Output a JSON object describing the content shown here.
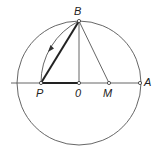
{
  "diagram": {
    "title": "",
    "type": "geometric-construction",
    "stroke_color": "#444444",
    "points": [
      {
        "id": "B",
        "label": "B",
        "x": 79,
        "y": 21
      },
      {
        "id": "P",
        "label": "P",
        "x": 41,
        "y": 83
      },
      {
        "id": "O",
        "label": "0",
        "x": 79,
        "y": 83
      },
      {
        "id": "M",
        "label": "M",
        "x": 109,
        "y": 83
      },
      {
        "id": "A",
        "label": "A",
        "x": 140,
        "y": 83
      }
    ],
    "circle": {
      "center": "O",
      "radius": 62
    },
    "segments": [
      {
        "from": "P",
        "to": "B",
        "weight": "bold"
      },
      {
        "from": "P",
        "to": "O",
        "weight": "bold"
      },
      {
        "from": "O",
        "to": "B",
        "weight": "thin"
      },
      {
        "from": "M",
        "to": "B",
        "weight": "thin"
      },
      {
        "from": "P",
        "to": "A",
        "weight": "thin",
        "note": "horizontal axis line"
      }
    ],
    "arc": {
      "center": "M",
      "from": "B",
      "to": "P",
      "arrow": "toward P"
    }
  }
}
